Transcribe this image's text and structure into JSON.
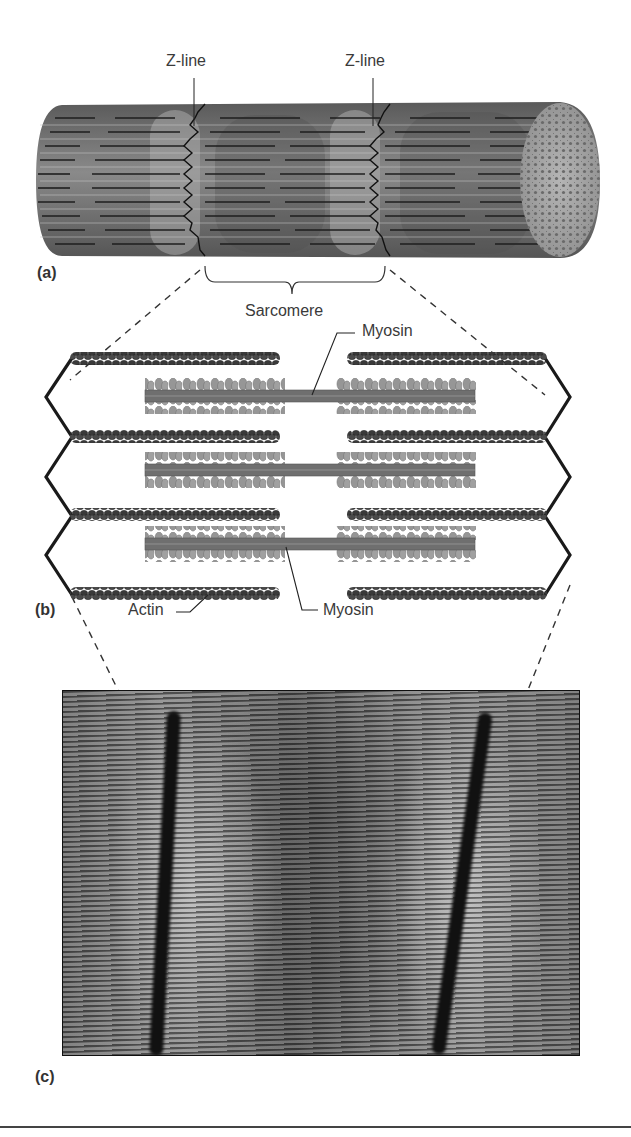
{
  "figure": {
    "panels": [
      {
        "id": "a",
        "letter": "(a)",
        "description": "Muscle myofibril cylinder with striations",
        "labels": {
          "z_line_left": "Z-line",
          "z_line_right": "Z-line",
          "sarcomere": "Sarcomere"
        }
      },
      {
        "id": "b",
        "letter": "(b)",
        "description": "Sarcomere filament arrangement: actin thin filaments anchored to zig-zag Z-lines, myosin thick filaments in center",
        "labels": {
          "myosin_top": "Myosin",
          "myosin_bottom": "Myosin",
          "actin": "Actin"
        }
      },
      {
        "id": "c",
        "letter": "(c)",
        "description": "Electron micrograph of a sarcomere showing dark Z-bands"
      }
    ],
    "colors": {
      "filament_dark": "#2a2a2a",
      "myosin_gray": "#7a7a7a",
      "cylinder_gray": "#6e6e6e",
      "zline": "#1a1a1a",
      "label_text": "#3a3a3a"
    }
  }
}
